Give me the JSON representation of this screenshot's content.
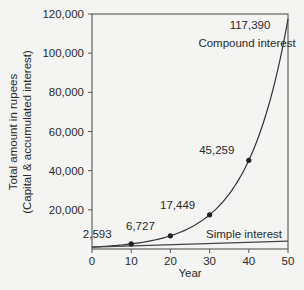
{
  "chart_data": {
    "type": "line",
    "title": "",
    "xlabel": "Year",
    "ylabel": "Total amount in rupees",
    "ylabel_sub": "(Capital & accumulated interest)",
    "xlim": [
      0,
      50
    ],
    "ylim": [
      0,
      120000
    ],
    "x_ticks": [
      0,
      10,
      20,
      30,
      40,
      50
    ],
    "x_tick_labels": [
      "0",
      "10",
      "20",
      "30",
      "40",
      "50"
    ],
    "y_ticks": [
      20000,
      40000,
      60000,
      80000,
      100000,
      120000
    ],
    "y_tick_labels": [
      "20,000",
      "40,000",
      "60,000",
      "80,000",
      "100,000",
      "120,000"
    ],
    "grid": false,
    "legend": null,
    "series": [
      {
        "name": "Compound interest",
        "x": [
          0,
          10,
          20,
          30,
          40,
          50
        ],
        "values": [
          1000,
          2593,
          6727,
          17449,
          45259,
          117390
        ],
        "markers_at": [
          10,
          20,
          30,
          40
        ],
        "point_labels": [
          "",
          "2,593",
          "6,727",
          "17,449",
          "45,259",
          "117,390"
        ]
      },
      {
        "name": "Simple interest",
        "x": [
          0,
          50
        ],
        "values": [
          1000,
          4000
        ]
      }
    ],
    "annotations": [
      {
        "text": "Compound interest",
        "near": "upper right"
      },
      {
        "text": "Simple interest",
        "near": "lower right, above line"
      }
    ]
  }
}
